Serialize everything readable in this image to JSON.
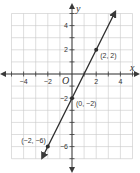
{
  "chart_data": {
    "type": "line",
    "title": "",
    "xlabel": "x",
    "ylabel": "y",
    "xlim": [
      -5,
      5
    ],
    "ylim": [
      -7,
      5
    ],
    "grid": true,
    "origin_label": "O",
    "x_ticks": [
      -4,
      -2,
      2,
      4
    ],
    "x_tick_labels": [
      "−4",
      "−2",
      "2",
      "4"
    ],
    "y_ticks": [
      4,
      2,
      -2,
      -6
    ],
    "y_tick_labels": [
      "4",
      "2",
      "−2",
      "−6"
    ],
    "series": [
      {
        "name": "line",
        "equation": "y = 2x - 2",
        "slope": 2,
        "intercept": -2,
        "x_range": [
          -2.4,
          3.5
        ]
      }
    ],
    "points": [
      {
        "x": 2,
        "y": 2,
        "label": "(2, 2)",
        "label_pos": "right"
      },
      {
        "x": 0,
        "y": -2,
        "label": "(0, −2)",
        "label_pos": "right"
      },
      {
        "x": -2,
        "y": -6,
        "label": "(−2, −6)",
        "label_pos": "left"
      }
    ]
  }
}
